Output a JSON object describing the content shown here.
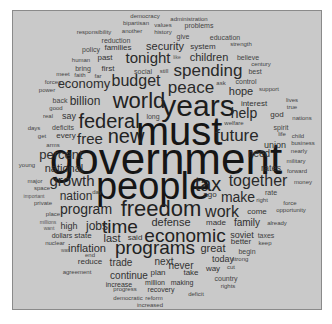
{
  "cloud": {
    "title": "",
    "background": "#c9c9c9",
    "words": [
      {
        "text": "government",
        "x": 165,
        "y": 158,
        "size": 44,
        "color": "#151515"
      },
      {
        "text": "must",
        "x": 178,
        "y": 130,
        "size": 40,
        "color": "#151515"
      },
      {
        "text": "people",
        "x": 152,
        "y": 185,
        "size": 38,
        "color": "#151515"
      },
      {
        "text": "years",
        "x": 197,
        "y": 105,
        "size": 30,
        "color": "#1c1c1c"
      },
      {
        "text": "world",
        "x": 138,
        "y": 100,
        "size": 22,
        "color": "#222"
      },
      {
        "text": "freedom",
        "x": 160,
        "y": 208,
        "size": 22,
        "color": "#222"
      },
      {
        "text": "new",
        "x": 125,
        "y": 135,
        "size": 20,
        "color": "#222"
      },
      {
        "text": "federal",
        "x": 108,
        "y": 120,
        "size": 20,
        "color": "#222"
      },
      {
        "text": "tax",
        "x": 207,
        "y": 183,
        "size": 20,
        "color": "#222"
      },
      {
        "text": "programs",
        "x": 154,
        "y": 246,
        "size": 19,
        "color": "#222"
      },
      {
        "text": "economic",
        "x": 184,
        "y": 234,
        "size": 19,
        "color": "#222"
      },
      {
        "text": "time",
        "x": 119,
        "y": 225,
        "size": 19,
        "color": "#222"
      },
      {
        "text": "peace",
        "x": 190,
        "y": 86,
        "size": 17,
        "color": "#2a2a2a"
      },
      {
        "text": "spending",
        "x": 207,
        "y": 69,
        "size": 17,
        "color": "#2a2a2a"
      },
      {
        "text": "budget",
        "x": 135,
        "y": 80,
        "size": 16,
        "color": "#2a2a2a"
      },
      {
        "text": "future",
        "x": 236,
        "y": 134,
        "size": 17,
        "color": "#2a2a2a"
      },
      {
        "text": "together",
        "x": 257,
        "y": 180,
        "size": 16,
        "color": "#2a2a2a"
      },
      {
        "text": "work",
        "x": 221,
        "y": 211,
        "size": 16,
        "color": "#2a2a2a"
      },
      {
        "text": "free",
        "x": 89,
        "y": 137,
        "size": 15,
        "color": "#2a2a2a"
      },
      {
        "text": "tonight",
        "x": 147,
        "y": 56,
        "size": 15,
        "color": "#2a2a2a"
      },
      {
        "text": "growth",
        "x": 71,
        "y": 179,
        "size": 15,
        "color": "#2a2a2a"
      },
      {
        "text": "program",
        "x": 85,
        "y": 208,
        "size": 14,
        "color": "#2a2a2a"
      },
      {
        "text": "make",
        "x": 237,
        "y": 196,
        "size": 14,
        "color": "#2a2a2a"
      },
      {
        "text": "help",
        "x": 243,
        "y": 112,
        "size": 14,
        "color": "#2a2a2a"
      },
      {
        "text": "percent",
        "x": 60,
        "y": 153,
        "size": 13,
        "color": "#2e2e2e"
      },
      {
        "text": "economy",
        "x": 83,
        "y": 82,
        "size": 13,
        "color": "#2e2e2e"
      },
      {
        "text": "billion",
        "x": 84,
        "y": 100,
        "size": 12,
        "color": "#2e2e2e"
      },
      {
        "text": "nation",
        "x": 75,
        "y": 195,
        "size": 12,
        "color": "#2e2e2e"
      },
      {
        "text": "national",
        "x": 63,
        "y": 167,
        "size": 11,
        "color": "#2e2e2e"
      },
      {
        "text": "defense",
        "x": 170,
        "y": 221,
        "size": 11,
        "color": "#2e2e2e"
      },
      {
        "text": "jobs",
        "x": 96,
        "y": 225,
        "size": 12,
        "color": "#2e2e2e"
      },
      {
        "text": "last",
        "x": 111,
        "y": 237,
        "size": 11,
        "color": "#2e2e2e"
      },
      {
        "text": "inflation",
        "x": 86,
        "y": 247,
        "size": 11,
        "color": "#2e2e2e"
      },
      {
        "text": "great",
        "x": 212,
        "y": 247,
        "size": 11,
        "color": "#2e2e2e"
      },
      {
        "text": "hope",
        "x": 240,
        "y": 90,
        "size": 11,
        "color": "#2e2e2e"
      },
      {
        "text": "security",
        "x": 164,
        "y": 45,
        "size": 11,
        "color": "#2e2e2e"
      },
      {
        "text": "children",
        "x": 208,
        "y": 56,
        "size": 11,
        "color": "#2e2e2e"
      },
      {
        "text": "family",
        "x": 246,
        "y": 222,
        "size": 10,
        "color": "#2e2e2e"
      },
      {
        "text": "soviet",
        "x": 241,
        "y": 234,
        "size": 9,
        "color": "#333"
      },
      {
        "text": "next",
        "x": 163,
        "y": 261,
        "size": 10,
        "color": "#333"
      },
      {
        "text": "never",
        "x": 180,
        "y": 265,
        "size": 10,
        "color": "#333"
      },
      {
        "text": "trade",
        "x": 120,
        "y": 262,
        "size": 10,
        "color": "#333"
      },
      {
        "text": "continue",
        "x": 128,
        "y": 275,
        "size": 10,
        "color": "#333"
      },
      {
        "text": "union",
        "x": 274,
        "y": 144,
        "size": 9,
        "color": "#333"
      },
      {
        "text": "need",
        "x": 258,
        "y": 153,
        "size": 10,
        "color": "#333"
      },
      {
        "text": "rates",
        "x": 270,
        "y": 167,
        "size": 9,
        "color": "#333"
      },
      {
        "text": "today",
        "x": 222,
        "y": 258,
        "size": 9,
        "color": "#333"
      },
      {
        "text": "high",
        "x": 68,
        "y": 225,
        "size": 9,
        "color": "#333"
      },
      {
        "text": "say",
        "x": 68,
        "y": 115,
        "size": 9,
        "color": "#333"
      },
      {
        "text": "made",
        "x": 215,
        "y": 222,
        "size": 8,
        "color": "#333"
      },
      {
        "text": "said",
        "x": 134,
        "y": 237,
        "size": 8,
        "color": "#333"
      },
      {
        "text": "state",
        "x": 82,
        "y": 235,
        "size": 8,
        "color": "#333"
      },
      {
        "text": "dollars",
        "x": 61,
        "y": 234,
        "size": 7,
        "color": "#333"
      },
      {
        "text": "reduce",
        "x": 89,
        "y": 261,
        "size": 8,
        "color": "#333"
      },
      {
        "text": "plan",
        "x": 157,
        "y": 272,
        "size": 8,
        "color": "#333"
      },
      {
        "text": "take",
        "x": 190,
        "y": 272,
        "size": 8,
        "color": "#333"
      },
      {
        "text": "million",
        "x": 154,
        "y": 281,
        "size": 7,
        "color": "#333"
      },
      {
        "text": "making",
        "x": 181,
        "y": 281,
        "size": 7,
        "color": "#333"
      },
      {
        "text": "increase",
        "x": 118,
        "y": 283,
        "size": 7,
        "color": "#333"
      },
      {
        "text": "recovery",
        "x": 160,
        "y": 288,
        "size": 7,
        "color": "#333"
      },
      {
        "text": "progress",
        "x": 124,
        "y": 288,
        "size": 6,
        "color": "#444"
      },
      {
        "text": "democratic",
        "x": 127,
        "y": 297,
        "size": 6,
        "color": "#444"
      },
      {
        "text": "reform",
        "x": 153,
        "y": 297,
        "size": 6,
        "color": "#444"
      },
      {
        "text": "increased",
        "x": 149,
        "y": 304,
        "size": 6,
        "color": "#444"
      },
      {
        "text": "deficit",
        "x": 195,
        "y": 293,
        "size": 6,
        "color": "#444"
      },
      {
        "text": "country",
        "x": 225,
        "y": 277,
        "size": 7,
        "color": "#444"
      },
      {
        "text": "rights",
        "x": 227,
        "y": 285,
        "size": 6,
        "color": "#444"
      },
      {
        "text": "way",
        "x": 212,
        "y": 268,
        "size": 8,
        "color": "#333"
      },
      {
        "text": "cut",
        "x": 230,
        "y": 266,
        "size": 6,
        "color": "#444"
      },
      {
        "text": "strong",
        "x": 239,
        "y": 258,
        "size": 6,
        "color": "#444"
      },
      {
        "text": "begin",
        "x": 246,
        "y": 250,
        "size": 7,
        "color": "#444"
      },
      {
        "text": "better",
        "x": 240,
        "y": 241,
        "size": 8,
        "color": "#333"
      },
      {
        "text": "keep",
        "x": 264,
        "y": 242,
        "size": 6,
        "color": "#444"
      },
      {
        "text": "taxes",
        "x": 265,
        "y": 234,
        "size": 7,
        "color": "#444"
      },
      {
        "text": "already",
        "x": 276,
        "y": 222,
        "size": 6,
        "color": "#444"
      },
      {
        "text": "come",
        "x": 256,
        "y": 211,
        "size": 8,
        "color": "#333"
      },
      {
        "text": "opportunity",
        "x": 290,
        "y": 209,
        "size": 6,
        "color": "#444"
      },
      {
        "text": "force",
        "x": 289,
        "y": 202,
        "size": 6,
        "color": "#444"
      },
      {
        "text": "right",
        "x": 261,
        "y": 199,
        "size": 6,
        "color": "#444"
      },
      {
        "text": "rate",
        "x": 270,
        "y": 191,
        "size": 7,
        "color": "#444"
      },
      {
        "text": "ago",
        "x": 209,
        "y": 194,
        "size": 8,
        "color": "#333"
      },
      {
        "text": "money",
        "x": 302,
        "y": 181,
        "size": 6,
        "color": "#444"
      },
      {
        "text": "forward",
        "x": 296,
        "y": 170,
        "size": 6,
        "color": "#444"
      },
      {
        "text": "military",
        "x": 295,
        "y": 160,
        "size": 6,
        "color": "#444"
      },
      {
        "text": "nearly",
        "x": 298,
        "y": 150,
        "size": 6,
        "color": "#444"
      },
      {
        "text": "business",
        "x": 302,
        "y": 142,
        "size": 6,
        "color": "#444"
      },
      {
        "text": "child",
        "x": 297,
        "y": 135,
        "size": 6,
        "color": "#444"
      },
      {
        "text": "life",
        "x": 281,
        "y": 133,
        "size": 6,
        "color": "#444"
      },
      {
        "text": "spirit",
        "x": 280,
        "y": 126,
        "size": 7,
        "color": "#444"
      },
      {
        "text": "nations",
        "x": 301,
        "y": 117,
        "size": 6,
        "color": "#444"
      },
      {
        "text": "god",
        "x": 276,
        "y": 114,
        "size": 8,
        "color": "#333"
      },
      {
        "text": "true",
        "x": 291,
        "y": 106,
        "size": 6,
        "color": "#444"
      },
      {
        "text": "lives",
        "x": 291,
        "y": 99,
        "size": 6,
        "color": "#444"
      },
      {
        "text": "interest",
        "x": 253,
        "y": 103,
        "size": 8,
        "color": "#333"
      },
      {
        "text": "welfare",
        "x": 233,
        "y": 122,
        "size": 6,
        "color": "#444"
      },
      {
        "text": "long",
        "x": 152,
        "y": 115,
        "size": 7,
        "color": "#444"
      },
      {
        "text": "support",
        "x": 268,
        "y": 88,
        "size": 6,
        "color": "#444"
      },
      {
        "text": "ask",
        "x": 220,
        "y": 82,
        "size": 6,
        "color": "#444"
      },
      {
        "text": "control",
        "x": 245,
        "y": 80,
        "size": 7,
        "color": "#444"
      },
      {
        "text": "best",
        "x": 254,
        "y": 70,
        "size": 7,
        "color": "#444"
      },
      {
        "text": "century",
        "x": 260,
        "y": 63,
        "size": 6,
        "color": "#444"
      },
      {
        "text": "believe",
        "x": 247,
        "y": 56,
        "size": 7,
        "color": "#444"
      },
      {
        "text": "strength",
        "x": 240,
        "y": 43,
        "size": 6,
        "color": "#444"
      },
      {
        "text": "system",
        "x": 202,
        "y": 46,
        "size": 8,
        "color": "#333"
      },
      {
        "text": "education",
        "x": 224,
        "y": 36,
        "size": 7,
        "color": "#444"
      },
      {
        "text": "give",
        "x": 182,
        "y": 35,
        "size": 7,
        "color": "#444"
      },
      {
        "text": "problems",
        "x": 198,
        "y": 24,
        "size": 7,
        "color": "#444"
      },
      {
        "text": "values",
        "x": 162,
        "y": 24,
        "size": 6,
        "color": "#444"
      },
      {
        "text": "administration",
        "x": 188,
        "y": 18,
        "size": 6,
        "color": "#444"
      },
      {
        "text": "democracy",
        "x": 144,
        "y": 15,
        "size": 6,
        "color": "#444"
      },
      {
        "text": "bipartisan",
        "x": 135,
        "y": 22,
        "size": 6,
        "color": "#444"
      },
      {
        "text": "history",
        "x": 162,
        "y": 31,
        "size": 6,
        "color": "#444"
      },
      {
        "text": "another",
        "x": 131,
        "y": 30,
        "size": 6,
        "color": "#444"
      },
      {
        "text": "responsibility",
        "x": 93,
        "y": 31,
        "size": 6,
        "color": "#444"
      },
      {
        "text": "reduction",
        "x": 115,
        "y": 39,
        "size": 7,
        "color": "#444"
      },
      {
        "text": "families",
        "x": 117,
        "y": 47,
        "size": 8,
        "color": "#333"
      },
      {
        "text": "policy",
        "x": 90,
        "y": 48,
        "size": 7,
        "color": "#444"
      },
      {
        "text": "like",
        "x": 176,
        "y": 56,
        "size": 5,
        "color": "#555"
      },
      {
        "text": "past",
        "x": 104,
        "y": 57,
        "size": 8,
        "color": "#333"
      },
      {
        "text": "human",
        "x": 80,
        "y": 59,
        "size": 6,
        "color": "#444"
      },
      {
        "text": "bring",
        "x": 82,
        "y": 67,
        "size": 7,
        "color": "#444"
      },
      {
        "text": "first",
        "x": 107,
        "y": 68,
        "size": 8,
        "color": "#333"
      },
      {
        "text": "social",
        "x": 142,
        "y": 70,
        "size": 7,
        "color": "#444"
      },
      {
        "text": "still",
        "x": 163,
        "y": 70,
        "size": 6,
        "color": "#444"
      },
      {
        "text": "meet",
        "x": 62,
        "y": 73,
        "size": 6,
        "color": "#444"
      },
      {
        "text": "faith",
        "x": 79,
        "y": 74,
        "size": 6,
        "color": "#444"
      },
      {
        "text": "far",
        "x": 97,
        "y": 75,
        "size": 6,
        "color": "#444"
      },
      {
        "text": "forces",
        "x": 52,
        "y": 81,
        "size": 6,
        "color": "#444"
      },
      {
        "text": "power",
        "x": 46,
        "y": 89,
        "size": 6,
        "color": "#444"
      },
      {
        "text": "back",
        "x": 59,
        "y": 99,
        "size": 7,
        "color": "#444"
      },
      {
        "text": "good",
        "x": 55,
        "y": 107,
        "size": 6,
        "color": "#444"
      },
      {
        "text": "real",
        "x": 47,
        "y": 115,
        "size": 6,
        "color": "#444"
      },
      {
        "text": "days",
        "x": 33,
        "y": 127,
        "size": 6,
        "color": "#444"
      },
      {
        "text": "deficits",
        "x": 62,
        "y": 126,
        "size": 7,
        "color": "#444"
      },
      {
        "text": "get",
        "x": 41,
        "y": 135,
        "size": 6,
        "color": "#444"
      },
      {
        "text": "every",
        "x": 65,
        "y": 135,
        "size": 8,
        "color": "#333"
      },
      {
        "text": "arms",
        "x": 52,
        "y": 144,
        "size": 6,
        "color": "#444"
      },
      {
        "text": "young",
        "x": 26,
        "y": 164,
        "size": 6,
        "color": "#444"
      },
      {
        "text": "major",
        "x": 34,
        "y": 180,
        "size": 6,
        "color": "#444"
      },
      {
        "text": "space",
        "x": 41,
        "y": 187,
        "size": 6,
        "color": "#444"
      },
      {
        "text": "important",
        "x": 33,
        "y": 195,
        "size": 5,
        "color": "#555"
      },
      {
        "text": "private",
        "x": 42,
        "y": 202,
        "size": 6,
        "color": "#444"
      },
      {
        "text": "day",
        "x": 96,
        "y": 191,
        "size": 6,
        "color": "#444"
      },
      {
        "text": "place",
        "x": 52,
        "y": 213,
        "size": 6,
        "color": "#444"
      },
      {
        "text": "millions",
        "x": 47,
        "y": 221,
        "size": 5,
        "color": "#555"
      },
      {
        "text": "want",
        "x": 48,
        "y": 227,
        "size": 5,
        "color": "#555"
      },
      {
        "text": "nuclear",
        "x": 54,
        "y": 242,
        "size": 6,
        "color": "#444"
      },
      {
        "text": "war",
        "x": 64,
        "y": 249,
        "size": 5,
        "color": "#555"
      },
      {
        "text": "end",
        "x": 89,
        "y": 254,
        "size": 6,
        "color": "#444"
      },
      {
        "text": "agreement",
        "x": 76,
        "y": 271,
        "size": 6,
        "color": "#444"
      }
    ]
  }
}
